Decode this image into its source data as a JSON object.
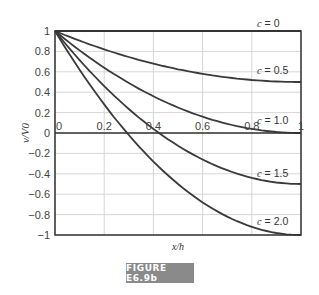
{
  "chart_data": {
    "type": "line",
    "title": "",
    "xlabel": "x/h",
    "ylabel": "v/V0",
    "xlim": [
      0,
      1
    ],
    "ylim": [
      -1,
      1
    ],
    "xticks": [
      "0",
      "0.2",
      "0.4",
      "0.6",
      "0.8",
      "1"
    ],
    "yticks": [
      "1",
      "0.8",
      "0.6",
      "0.4",
      "0.2",
      "0",
      "−0.2",
      "−0.4",
      "−0.6",
      "−0.8",
      "−1"
    ],
    "grid": true,
    "x": [
      0,
      0.1,
      0.2,
      0.3,
      0.4,
      0.5,
      0.6,
      0.7,
      0.8,
      0.9,
      1.0
    ],
    "series": [
      {
        "name": "c = 0",
        "values": [
          1,
          1,
          1,
          1,
          1,
          1,
          1,
          1,
          1,
          1,
          1
        ]
      },
      {
        "name": "c = 0.5",
        "values": [
          1,
          0.905,
          0.82,
          0.745,
          0.68,
          0.625,
          0.58,
          0.545,
          0.52,
          0.505,
          0.5
        ]
      },
      {
        "name": "c = 1.0",
        "values": [
          1,
          0.81,
          0.64,
          0.49,
          0.36,
          0.25,
          0.16,
          0.09,
          0.04,
          0.01,
          0
        ]
      },
      {
        "name": "c = 1.5",
        "values": [
          1,
          0.715,
          0.46,
          0.235,
          0.04,
          -0.125,
          -0.26,
          -0.365,
          -0.44,
          -0.485,
          -0.5
        ]
      },
      {
        "name": "c = 2.0",
        "values": [
          1,
          0.62,
          0.28,
          -0.02,
          -0.28,
          -0.5,
          -0.68,
          -0.82,
          -0.92,
          -0.98,
          -1
        ]
      }
    ],
    "annotations": [
      "c = 0",
      "c = 0.5",
      "c = 1.0",
      "c = 1.5",
      "c = 2.0"
    ]
  },
  "figure_label": "FIGURE E6.9b"
}
